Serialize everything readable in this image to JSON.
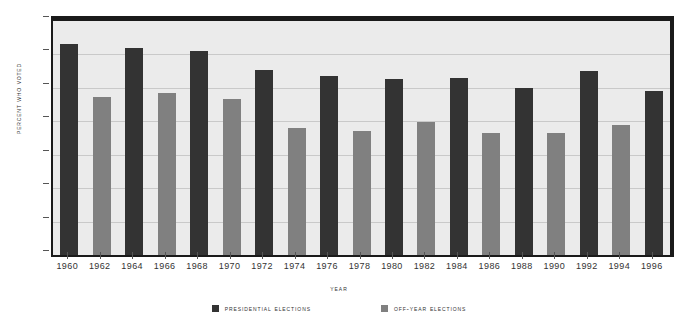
{
  "chart_data": {
    "type": "bar",
    "title": "",
    "xlabel": "Year",
    "ylabel": "Percent Who Voted",
    "ylim": [
      0,
      70
    ],
    "yticks": [
      0,
      10,
      20,
      30,
      40,
      50,
      60,
      70
    ],
    "grid": true,
    "legend_position": "bottom",
    "categories": [
      "1960",
      "1962",
      "1964",
      "1966",
      "1968",
      "1970",
      "1972",
      "1974",
      "1976",
      "1978",
      "1980",
      "1982",
      "1984",
      "1986",
      "1988",
      "1990",
      "1992",
      "1994",
      "1996"
    ],
    "values": [
      63.1,
      47.3,
      61.9,
      48.4,
      60.9,
      46.6,
      55.2,
      38.0,
      53.6,
      37.2,
      52.6,
      39.8,
      53.1,
      36.4,
      50.1,
      36.5,
      55.1,
      38.8,
      49.1
    ],
    "point_series": [
      "presidential",
      "off-year",
      "presidential",
      "off-year",
      "presidential",
      "off-year",
      "presidential",
      "off-year",
      "presidential",
      "off-year",
      "presidential",
      "off-year",
      "presidential",
      "off-year",
      "presidential",
      "off-year",
      "presidential",
      "off-year",
      "presidential"
    ],
    "series": [
      {
        "name": "Presidential Elections",
        "key": "presidential",
        "color": "#333333",
        "x": [
          "1960",
          "1964",
          "1968",
          "1972",
          "1976",
          "1980",
          "1984",
          "1988",
          "1992",
          "1996"
        ],
        "values": [
          63.1,
          61.9,
          60.9,
          55.2,
          53.6,
          52.6,
          53.1,
          50.1,
          55.1,
          49.1
        ]
      },
      {
        "name": "Off-Year Elections",
        "key": "off-year",
        "color": "#808080",
        "x": [
          "1962",
          "1966",
          "1970",
          "1974",
          "1978",
          "1982",
          "1986",
          "1990",
          "1994"
        ],
        "values": [
          47.3,
          48.4,
          46.6,
          38.0,
          37.2,
          39.8,
          36.4,
          36.5,
          38.8
        ]
      }
    ]
  },
  "axes": {
    "y_title": "Percent Who Voted",
    "x_title": "Year",
    "y_tick_labels": [
      "70",
      "60",
      "50",
      "40",
      "30",
      "20",
      "10",
      "0"
    ],
    "x_tick_labels": [
      "1960",
      "1962",
      "1964",
      "1966",
      "1968",
      "1970",
      "1972",
      "1974",
      "1976",
      "1978",
      "1980",
      "1982",
      "1984",
      "1986",
      "1988",
      "1990",
      "1992",
      "1994",
      "1996"
    ]
  },
  "legend": {
    "items": [
      {
        "label": "Presidential Elections",
        "swatch": "presidential",
        "color": "#333333"
      },
      {
        "label": "Off-Year Elections",
        "swatch": "off-year",
        "color": "#808080"
      }
    ]
  },
  "colors": {
    "presidential": "#333333",
    "off_year": "#808080",
    "plot_background": "#ebebeb",
    "frame": "#1a1a1a",
    "gridline": "#c9c9c9",
    "text": "#333333",
    "page_background": "#ffffff"
  }
}
